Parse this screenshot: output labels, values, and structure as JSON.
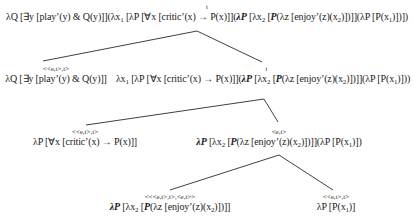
{
  "diagram": {
    "kind": "semantic-derivation-tree",
    "nodes": {
      "root": {
        "type": "t",
        "expr_parts": [
          "λQ [∃y [play’(y) & Q(y)]](λx",
          "1",
          " [λP [∀x [critic’(x) → P(x)]](",
          "λP",
          " [λx",
          "2",
          " [",
          "P",
          "(λz [enjoy’(z)(x",
          "2",
          ")])]](λP [P(x",
          "1",
          ")])])"
        ]
      },
      "subject_quantifier": {
        "type": "<<e,t>,t>",
        "expr": "λQ [∃y [play’(y) & Q(y)]]"
      },
      "lambda_abstract": {
        "type": "t",
        "expr_parts": [
          "λx",
          "1",
          " [λP [∀x [critic’(x) → P(x)]](",
          "λP",
          " [λx",
          "2",
          " [",
          "P",
          "(λz [enjoy’(z)(x",
          "2",
          ")])]](λP [P(x",
          "1",
          ")]))"
        ]
      },
      "every_critic": {
        "type": "<<e,t>,t>",
        "expr": "λP [∀x [critic’(x) → P(x)]]"
      },
      "vp": {
        "type": "<e,t>",
        "expr_parts": [
          "λP",
          " [λx",
          "2",
          " [",
          "P",
          "(λz [enjoy’(z)(x",
          "2",
          ")])]](λP [P(x",
          "1",
          ")])"
        ]
      },
      "enjoy_functor": {
        "type": "<<<e,t>,t>,<e,t>>",
        "expr_parts": [
          "λP",
          " [λx",
          "2",
          " [",
          "P",
          "(λz [enjoy’(z)(x",
          "2",
          ")])]]"
        ]
      },
      "trace_quantifier": {
        "type": "<<e,t>,t>",
        "expr_parts": [
          "λP [P(x",
          "1",
          ")]"
        ]
      }
    },
    "edges": [
      {
        "from": "root",
        "to": "subject_quantifier",
        "x1": 197,
        "y1": 31,
        "x2": 43,
        "y2": 61
      },
      {
        "from": "root",
        "to": "lambda_abstract",
        "x1": 197,
        "y1": 31,
        "x2": 262,
        "y2": 62
      },
      {
        "from": "lambda_abstract",
        "to": "every_critic",
        "x1": 264,
        "y1": 99,
        "x2": 86,
        "y2": 125
      },
      {
        "from": "lambda_abstract",
        "to": "vp",
        "x1": 264,
        "y1": 99,
        "x2": 278,
        "y2": 122
      },
      {
        "from": "vp",
        "to": "enjoy_functor",
        "x1": 279,
        "y1": 155,
        "x2": 170,
        "y2": 190
      },
      {
        "from": "vp",
        "to": "trace_quantifier",
        "x1": 279,
        "y1": 155,
        "x2": 333,
        "y2": 190
      }
    ]
  }
}
